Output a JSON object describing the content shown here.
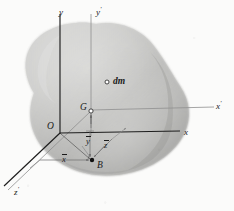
{
  "figure": {
    "caption": "",
    "body_label": "rigid-body-blob",
    "colors": {
      "body_fill_light": "#d8d8d6",
      "body_fill_mid": "#bdbdbb",
      "body_fill_dark": "#9a9a98",
      "axis_primary": "#1d1d1d",
      "axis_secondary": "#8f8f8f",
      "dimension_line": "#6f6f6f",
      "background": "#fbfbfa",
      "text": "#1a1a1a"
    }
  },
  "axes": [
    {
      "id": "y",
      "label": "y",
      "prime": "",
      "x": 59,
      "y": 6,
      "kind": "primary-vertical"
    },
    {
      "id": "yprime",
      "label": "y",
      "prime": "'",
      "x": 96,
      "y": 6,
      "kind": "secondary-vertical"
    },
    {
      "id": "x",
      "label": "x",
      "prime": "",
      "x": 184,
      "y": 126,
      "kind": "primary-horizontal"
    },
    {
      "id": "xprime",
      "label": "x",
      "prime": "'",
      "x": 216,
      "y": 100,
      "kind": "secondary-horizontal"
    },
    {
      "id": "zprime",
      "label": "z",
      "prime": "'",
      "x": 14,
      "y": 186,
      "kind": "secondary-depth"
    }
  ],
  "points": [
    {
      "id": "O",
      "label": "O",
      "prime": "",
      "label_x": 47,
      "label_y": 122,
      "mark_x": 60,
      "mark_y": 133,
      "marker": "none",
      "name": "origin-point-o"
    },
    {
      "id": "G",
      "label": "G",
      "prime": "",
      "label_x": 80,
      "label_y": 103,
      "mark_x": 91,
      "mark_y": 111,
      "marker": "open-circle",
      "name": "centroid-point-g"
    },
    {
      "id": "B",
      "label": "B",
      "prime": "",
      "label_x": 97,
      "label_y": 161,
      "mark_x": 92,
      "mark_y": 160,
      "marker": "filled-dot",
      "name": "point-b"
    },
    {
      "id": "dm",
      "label": "dm",
      "prime": "",
      "label_x": 113,
      "label_y": 77,
      "mark_x": 107,
      "mark_y": 82,
      "marker": "open-circle",
      "name": "mass-element-dm"
    }
  ],
  "dimensions": [
    {
      "id": "xbar",
      "label": "x",
      "overbar": true,
      "x": 62,
      "y": 155,
      "name": "dimension-x-bar"
    },
    {
      "id": "ybar",
      "label": "y",
      "overbar": true,
      "x": 86,
      "y": 137,
      "name": "dimension-y-bar"
    },
    {
      "id": "zbar",
      "label": "z",
      "overbar": true,
      "x": 104,
      "y": 141,
      "name": "dimension-z-bar"
    }
  ]
}
